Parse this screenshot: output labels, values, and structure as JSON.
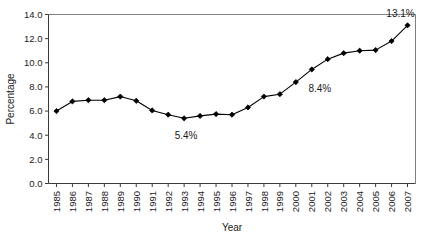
{
  "chart_data": {
    "type": "line",
    "title": "",
    "xlabel": "Year",
    "ylabel": "Percentage",
    "grid": false,
    "legend": "none",
    "ylim": [
      0.0,
      14.0
    ],
    "yticks": [
      "0.0",
      "2.0",
      "4.0",
      "6.0",
      "8.0",
      "10.0",
      "12.0",
      "14.0"
    ],
    "ytick_values": [
      0.0,
      2.0,
      4.0,
      6.0,
      8.0,
      10.0,
      12.0,
      14.0
    ],
    "categories": [
      "1985",
      "1986",
      "1987",
      "1988",
      "1989",
      "1990",
      "1991",
      "1992",
      "1993",
      "1994",
      "1995",
      "1996",
      "1997",
      "1998",
      "1999",
      "2000",
      "2001",
      "2002",
      "2003",
      "2004",
      "2005",
      "2006",
      "2007"
    ],
    "values": [
      6.0,
      6.8,
      6.9,
      6.9,
      7.2,
      6.85,
      6.05,
      5.7,
      5.4,
      5.6,
      5.75,
      5.7,
      6.3,
      7.2,
      7.4,
      8.4,
      9.45,
      10.3,
      10.8,
      11.0,
      11.05,
      11.8,
      13.1
    ],
    "series": [
      {
        "name": "Percentage",
        "values": [
          6.0,
          6.8,
          6.9,
          6.9,
          7.2,
          6.85,
          6.05,
          5.7,
          5.4,
          5.6,
          5.75,
          5.7,
          6.3,
          7.2,
          7.4,
          8.4,
          9.45,
          10.3,
          10.8,
          11.0,
          11.05,
          11.8,
          13.1
        ],
        "marker": "diamond",
        "color": "#000000"
      }
    ],
    "annotations": [
      {
        "label": "5.4%",
        "category": "1993",
        "value": 5.4
      },
      {
        "label": "8.4%",
        "category": "2000",
        "value": 8.4
      },
      {
        "label": "13.1%",
        "category": "2007",
        "value": 13.1
      }
    ]
  }
}
